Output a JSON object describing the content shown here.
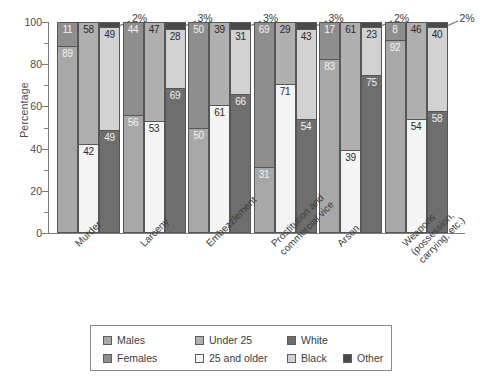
{
  "chart_data": {
    "type": "bar",
    "subtype": "grouped-stacked-100-percent",
    "title": "",
    "xlabel": "",
    "ylabel": "Percentage",
    "ylim": [
      0,
      100
    ],
    "y_ticks_major": [
      0,
      20,
      40,
      60,
      80,
      100
    ],
    "y_ticks_minor": [
      10,
      30,
      50,
      70,
      90
    ],
    "grid": false,
    "legend_position": "bottom",
    "categories": [
      "Murder",
      "Larceny",
      "Embezzlement",
      "Prostitution and commercial vice",
      "Arson",
      "Weapons (possession, carrying, etc.)"
    ],
    "series": [
      {
        "name": "Males",
        "stack": "sex",
        "values": [
          89,
          56,
          50,
          31,
          83,
          92
        ]
      },
      {
        "name": "Females",
        "stack": "sex",
        "values": [
          11,
          44,
          50,
          69,
          17,
          8
        ]
      },
      {
        "name": "Under 25",
        "stack": "age",
        "values": [
          58,
          47,
          39,
          29,
          61,
          46
        ]
      },
      {
        "name": "25 and older",
        "stack": "age",
        "values": [
          42,
          53,
          61,
          71,
          39,
          54
        ]
      },
      {
        "name": "White",
        "stack": "race",
        "values": [
          49,
          69,
          66,
          54,
          75,
          58
        ]
      },
      {
        "name": "Black",
        "stack": "race",
        "values": [
          49,
          28,
          31,
          43,
          23,
          40
        ]
      },
      {
        "name": "Other",
        "stack": "race",
        "values": [
          2,
          3,
          3,
          3,
          2,
          2
        ]
      }
    ],
    "other_callouts": [
      "2%",
      "3%",
      "3%",
      "3%",
      "2%",
      "2%"
    ]
  },
  "axis": {
    "y_title": "Percentage",
    "tick_labels": [
      "100",
      "80",
      "60",
      "40",
      "20",
      "0"
    ]
  },
  "legend": {
    "items": [
      {
        "label": "Males",
        "color": "#a8a8a8"
      },
      {
        "label": "Under 25",
        "color": "#b0b0b0"
      },
      {
        "label": "White",
        "color": "#6e6e6e"
      },
      {
        "label": "Females",
        "color": "#8e8e8e"
      },
      {
        "label": "25 and older",
        "color": "#f4f4f4"
      },
      {
        "label": "Black",
        "color": "#d2d2d2"
      },
      {
        "label": "Other",
        "color": "#4a4a4a"
      }
    ]
  }
}
